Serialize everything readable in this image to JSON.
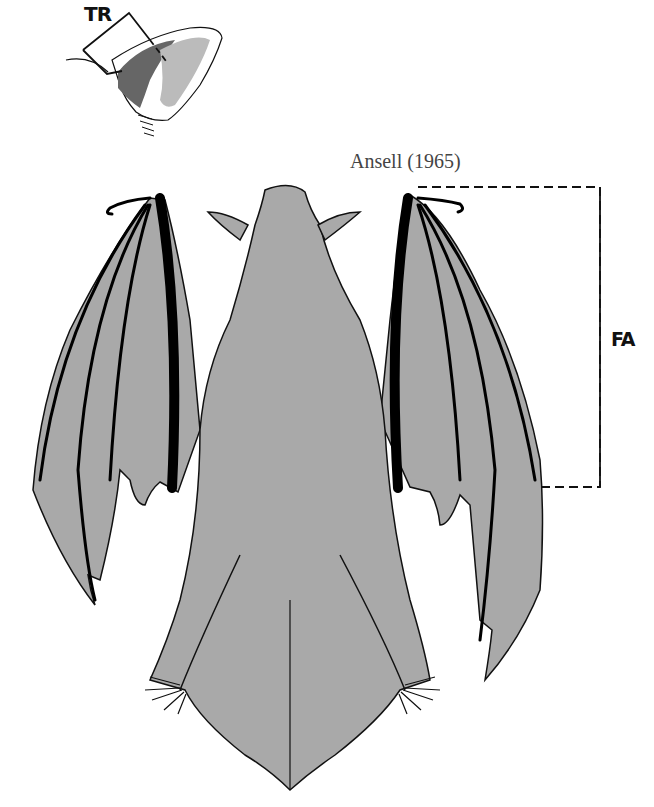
{
  "figure": {
    "citation": "Ansell (1965)",
    "labels": {
      "tragus": "TR",
      "forearm": "FA"
    },
    "colors": {
      "body_fill": "#a9a9a9",
      "outline": "#111111",
      "background": "#ffffff"
    },
    "elements": [
      "ear-inset-with-tragus-marker",
      "bat-dorsal-view",
      "forearm-measurement-bracket"
    ]
  }
}
